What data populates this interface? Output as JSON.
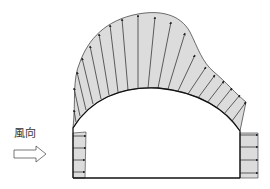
{
  "diagram": {
    "title": "",
    "wind_label": "風向",
    "colors": {
      "fill": "#d9d9d9",
      "stroke": "#222222",
      "arrow_outline": "#555555",
      "background": "#ffffff"
    },
    "tunnel": {
      "left_wall": {
        "x": 73,
        "y_top": 128,
        "y_bottom": 178
      },
      "right_wall": {
        "x": 240,
        "y_top": 131,
        "y_bottom": 178
      },
      "floor_y": 178,
      "arch_peak": {
        "x": 158,
        "y": 88
      }
    },
    "pressure_envelope_peak": {
      "x": 138,
      "y": 14
    },
    "components": [
      "wind-direction-label",
      "wind-direction-arrow",
      "roof-pressure-distribution",
      "windward-wall-pressure",
      "leeward-wall-pressure",
      "greenhouse-outline"
    ]
  }
}
